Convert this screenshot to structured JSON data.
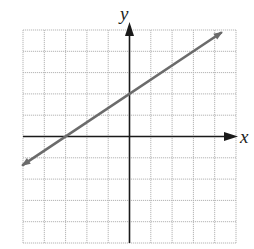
{
  "chart_data": {
    "type": "line",
    "title": "",
    "xlabel": "x",
    "ylabel": "y",
    "xlim": [
      -5,
      5
    ],
    "ylim": [
      -5,
      5
    ],
    "grid": true,
    "grid_step": 1,
    "tick_labels": false,
    "series": [
      {
        "name": "line",
        "equation": "y = (2/3)x + 2",
        "slope": 0.6667,
        "intercept": 2,
        "x": [
          -5,
          -3,
          0,
          3,
          4.3
        ],
        "y": [
          -1.33,
          0,
          2,
          4,
          4.87
        ],
        "arrows": "both",
        "color": "#6b6b6b"
      }
    ],
    "annotations": []
  },
  "colors": {
    "grid": "#b5b5b5",
    "axis": "#1a1a1a",
    "line": "#6b6b6b"
  }
}
